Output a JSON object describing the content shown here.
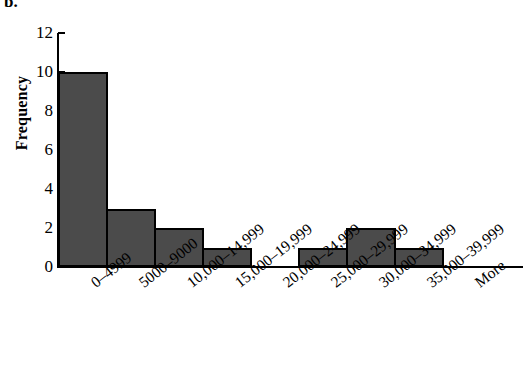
{
  "figure": {
    "panel_letter": "b.",
    "y_axis_title": "Frequency"
  },
  "chart_data": {
    "type": "bar",
    "title": "",
    "subtitle": "",
    "xlabel": "",
    "ylabel": "Frequency",
    "ylim": [
      0,
      12
    ],
    "y_ticks": [
      0,
      2,
      4,
      6,
      8,
      10,
      12
    ],
    "y_tick_labels": [
      "0",
      "2",
      "4",
      "6",
      "8",
      "10",
      "12"
    ],
    "grid": false,
    "legend": null,
    "bar_fill_color": "#4b4b4b",
    "bar_edge_color": "#000000",
    "axis_color": "#000000",
    "background_color": "#ffffff",
    "categories": [
      "0–4999",
      "5000–9000",
      "10,000–14,999",
      "15,000–19,999",
      "20,000–24,999",
      "25,000–29,999",
      "30,000–34,999",
      "35,000–39,999",
      "More"
    ],
    "values": [
      10,
      3,
      2,
      1,
      0,
      1,
      2,
      1,
      0
    ]
  }
}
